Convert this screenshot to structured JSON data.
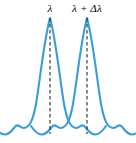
{
  "figure": {
    "background_color": "#ffffff",
    "curve_color": "#3a9ed4",
    "dashed_line_color": "#2b2b2b",
    "label_color": "#000000",
    "width": 136,
    "height": 143
  },
  "labels": {
    "left_peak": "λ",
    "right_peak": "λ + Δλ"
  },
  "chart_data": {
    "type": "line",
    "title": "",
    "xlabel": "",
    "ylabel": "",
    "grid": false,
    "legend": "none",
    "xlim": [
      0,
      136
    ],
    "ylim": [
      0,
      143
    ],
    "annotations": [
      {
        "text": "λ",
        "x": 50,
        "y": 8
      },
      {
        "text": "λ + Δλ",
        "x": 87,
        "y": 8
      }
    ],
    "markers": [
      {
        "name": "dashed-line-left",
        "x": 50,
        "y_top": 18,
        "y_bottom": 134
      },
      {
        "name": "dashed-line-right",
        "x": 87,
        "y_top": 18,
        "y_bottom": 134
      }
    ],
    "series": [
      {
        "name": "Line profile at λ",
        "peak_x": 50,
        "peak_y": 18,
        "baseline_y": 133,
        "path": "M -6,126 C 2,138 8,136 14,128 C 18,122 20,128 24,128 C 30,127 33,120 36,104 C 40,80 44,40 50,18 C 56,40 60,80 64,104 C 67,120 70,127 76,128 C 80,128 82,122 86,128 C 92,136 98,138 106,126"
      },
      {
        "name": "Line profile at λ + Δλ",
        "peak_x": 87,
        "peak_y": 18,
        "baseline_y": 133,
        "path": "M 31,126 C 39,138 45,136 51,128 C 55,122 57,128 61,128 C 67,127 70,120 73,104 C 77,80 81,40 87,18 C 93,40 97,80 101,104 C 104,120 107,127 113,128 C 117,128 119,122 123,128 C 129,136 135,138 143,126"
      }
    ]
  }
}
